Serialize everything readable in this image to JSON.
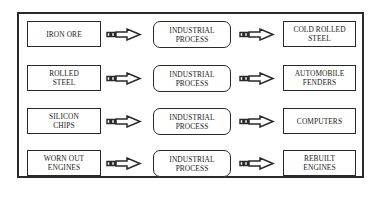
{
  "diagram": {
    "type": "process-flow",
    "rows": [
      {
        "input": "IRON ORE",
        "process": "INDUSTRIAL\nPROCESS",
        "output": "COLD ROLLED\nSTEEL"
      },
      {
        "input": "ROLLED\nSTEEL",
        "process": "INDUSTRIAL\nPROCESS",
        "output": "AUTOMOBILE\nFENDERS"
      },
      {
        "input": "SILICON\nCHIPS",
        "process": "INDUSTRIAL\nPROCESS",
        "output": "COMPUTERS"
      },
      {
        "input": "WORN OUT\nENGINES",
        "process": "INDUSTRIAL\nPROCESS",
        "output": "REBUILT\nENGINES"
      }
    ],
    "arrow_icon": "hollow-block-arrow-right",
    "colors": {
      "stroke": "#2a2a2a",
      "background": "#ffffff",
      "text": "#1a1a1a"
    }
  }
}
